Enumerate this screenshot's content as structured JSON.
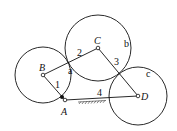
{
  "diagram": {
    "points": {
      "A": {
        "label": "A",
        "x": 65,
        "y": 100
      },
      "B": {
        "label": "B",
        "x": 43,
        "y": 75
      },
      "C": {
        "label": "C",
        "x": 98,
        "y": 48
      },
      "D": {
        "label": "D",
        "x": 138,
        "y": 96
      }
    },
    "links": [
      {
        "label": "1",
        "from": "A",
        "to": "B"
      },
      {
        "label": "2",
        "from": "B",
        "to": "C"
      },
      {
        "label": "3",
        "from": "C",
        "to": "D"
      },
      {
        "label": "4",
        "from": "A",
        "to": "D"
      }
    ],
    "circles": [
      {
        "label": "a",
        "center": "B",
        "r": 28
      },
      {
        "label": "b",
        "center": "C",
        "r": 33
      },
      {
        "label": "c",
        "center": "D",
        "r": 29
      }
    ],
    "ground_label": "fixed-ground-hatch",
    "stroke_color": "#111111"
  }
}
